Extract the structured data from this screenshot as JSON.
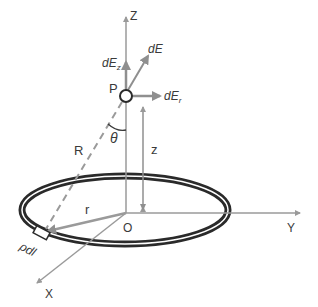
{
  "diagram": {
    "labels": {
      "z_axis": "Z",
      "y_axis": "Y",
      "x_axis": "X",
      "origin": "O",
      "point": "P",
      "dE": "dE",
      "dEz_base": "dE",
      "dEz_sub": "z",
      "dEr_base": "dE",
      "dEr_sub": "r",
      "theta": "θ",
      "R": "R",
      "r": "r",
      "z": "z",
      "charge_element": "ρdl"
    },
    "colors": {
      "axis": "#9a9a9a",
      "arrow": "#8f8f8f",
      "ring": "#2a2a2a",
      "text": "#3a3a3a"
    }
  }
}
